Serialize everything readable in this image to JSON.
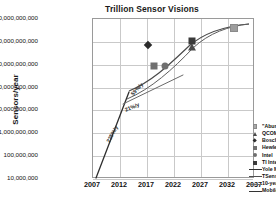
{
  "chart_data": {
    "type": "scatter",
    "title": "Trillion Sensor Visions",
    "xlabel": "",
    "ylabel": "Sensors/year",
    "xlim": [
      2007,
      2037
    ],
    "ylim": [
      10000000,
      100000000000000
    ],
    "yscale": "log",
    "grid": true,
    "legend_position": "inside-right",
    "xticks": [
      "2007",
      "2012",
      "2017",
      "2022",
      "2027",
      "2032",
      "2037"
    ],
    "yticks": [
      "100,000,000,000,000",
      "10,000,000,000,000",
      "1,000,000,000,000",
      "100,000,000,000",
      "10,000,000,000",
      "1,000,000,000",
      "100,000,000",
      "10,000,000"
    ],
    "points": [
      {
        "name": "\"Abundance\"",
        "x": 2033.2,
        "y": 40000000000000,
        "marker": "square-gray"
      },
      {
        "name": "QCOM Swarm Lab, UCB",
        "x": 2025.4,
        "y": 6000000000000,
        "marker": "triangle"
      },
      {
        "name": "Bosch",
        "x": 2017.2,
        "y": 7000000000000,
        "marker": "diamond"
      },
      {
        "name": "Hewlett-Packard",
        "x": 2018.3,
        "y": 900000000000,
        "marker": "square-mid"
      },
      {
        "name": "Intel",
        "x": 2020.3,
        "y": 900000000000,
        "marker": "circle"
      },
      {
        "name": "TI Internet devices",
        "x": 2025.4,
        "y": 11000000000000,
        "marker": "square"
      }
    ],
    "series": [
      {
        "name": "Yole MEMS Forecast, 2013",
        "style": "solid-dark"
      },
      {
        "name": "TSensors Bryzek's Vision",
        "style": "solid-gray"
      },
      {
        "name": "10-year slope",
        "style": "thin-gray"
      },
      {
        "name": "Mobile Sensors Explosion",
        "style": "solid-dark"
      }
    ],
    "annotations": [
      {
        "text": "225%/y",
        "x": 2010.6,
        "y": 900000000,
        "rotation": -62
      },
      {
        "text": "21%/y",
        "x": 2014.2,
        "y": 14000000000,
        "rotation": -22
      },
      {
        "text": "59%/y",
        "x": 2015.2,
        "y": 90000000000,
        "rotation": -48
      }
    ],
    "colors": {
      "marker_dark": "#3a3a3a",
      "marker_gray": "#9d9d9d",
      "marker_mid": "#707070",
      "grid": "#c9c9c9",
      "axis": "#9a9a9a",
      "text": "#111111"
    }
  },
  "legend": {
    "entries": [
      {
        "label": "\"Abundance\"",
        "key": "square-gray"
      },
      {
        "label": "QCOM Swarm Lab, UCB",
        "key": "triangle"
      },
      {
        "label": "Bosch",
        "key": "diamond"
      },
      {
        "label": "Hewlett-Packard",
        "key": "square-mid"
      },
      {
        "label": "Intel",
        "key": "circle"
      },
      {
        "label": "TI Internet devices",
        "key": "square"
      },
      {
        "label": "Yole MEMS Forecast, 2013",
        "key": "line-yole"
      },
      {
        "label": "TSensors Bryzek's Vision",
        "key": "line-tsensors"
      },
      {
        "label": "10-year slope",
        "key": "line-tenyear"
      },
      {
        "label": "Mobile Sensors Explosion",
        "key": "line-mobile"
      }
    ]
  }
}
